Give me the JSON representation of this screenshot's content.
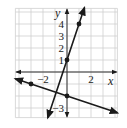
{
  "chart_data": {
    "type": "line",
    "title": "",
    "xlabel": "x",
    "ylabel": "y",
    "xlim": [
      -4.3,
      4.2
    ],
    "ylim": [
      -3.8,
      5.3
    ],
    "grid": true,
    "x_tick_labels": [
      {
        "value": -2,
        "label": "−2"
      },
      {
        "value": 2,
        "label": "2"
      }
    ],
    "y_tick_labels": [
      {
        "value": 1,
        "label": "1"
      },
      {
        "value": 2,
        "label": "2"
      },
      {
        "value": 3,
        "label": "3"
      },
      {
        "value": 4,
        "label": "4"
      },
      {
        "value": -3,
        "label": "−3"
      }
    ],
    "series": [
      {
        "name": "y = 3x + 1",
        "slope": 3,
        "intercept": 1,
        "marked_points": [
          [
            0,
            1
          ],
          [
            1,
            4
          ]
        ],
        "x_range": [
          -1.6,
          1.45
        ]
      },
      {
        "name": "y = -x/3 - 2",
        "slope": -0.3333,
        "intercept": -2,
        "marked_points": [
          [
            -3,
            -1
          ],
          [
            0,
            -2
          ]
        ],
        "x_range": [
          -4.3,
          4.2
        ]
      }
    ]
  },
  "axes": {
    "x_label": "x",
    "y_label": "y"
  },
  "colors": {
    "line": "#1a1a1a",
    "grid": "#cfcfcf",
    "axis": "#333333"
  }
}
